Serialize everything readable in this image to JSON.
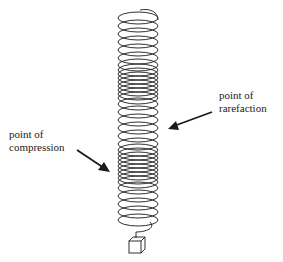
{
  "labels": {
    "compression": {
      "line1": "point of",
      "line2": "compression"
    },
    "rarefaction": {
      "line1": "point of",
      "line2": "rarefaction"
    }
  },
  "colors": {
    "stroke": "#1a1a1a",
    "background": "#ffffff"
  },
  "spring": {
    "center_x": 138,
    "radius_x": 20,
    "radius_y": 6,
    "coil_y_positions": [
      18,
      26,
      34,
      42,
      50,
      58,
      65,
      70,
      74,
      78,
      82,
      86,
      90,
      94,
      98,
      104,
      112,
      120,
      128,
      136,
      144,
      150,
      154,
      158,
      162,
      166,
      170,
      174,
      178,
      182,
      188,
      196,
      204,
      212,
      220
    ]
  }
}
